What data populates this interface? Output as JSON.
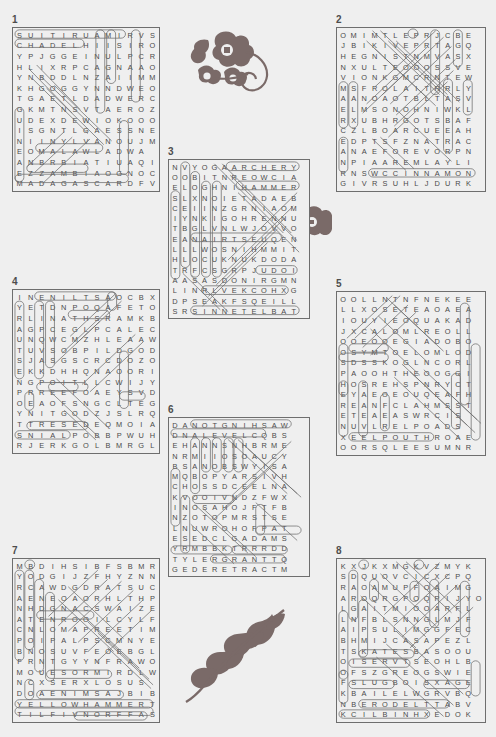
{
  "page": {
    "type": "word-search-answer-key",
    "background_color": "#efefef",
    "ink_color": "#5a5a5a",
    "puzzle_count": 8
  },
  "puzzles": [
    {
      "number": "1",
      "cols": 13,
      "rows": 16,
      "rows_text": [
        "SUITIRUAMIRVS",
        "CHADELHIISIRO",
        "YPJGGEINULPCR",
        "HLIXRPCAGNAAO",
        "YNBDDLNZAIIMM",
        "KHGOGGYNNDWEO",
        "TGAETLDADWERC",
        "GKMTNSVTAEROZ",
        "UDEXDEWIOKOOO",
        "ISGNTLGAESSNE",
        "NIINYLVANOUJM",
        "EOMALAWLADWA",
        "ANBRBIATIUAQI",
        "EZZAMBIAOGNOC",
        "MADAGASCARDFV"
      ]
    },
    {
      "number": "2",
      "cols": 14,
      "rows": 16,
      "rows_text": [
        "OMIMTLEPRJCBE",
        "JBIKIVEPRTAGQ",
        "HEGNISTNMVASX",
        "NXULTEOOOSSVE",
        "VIONKGMCRNTEW",
        "MSFROLAITRRLY",
        "AANOAOTBLTASV",
        "ELMSONOHNIWKL",
        "RXUBHRGOTSBAF",
        "CZLBOARCUEEAH",
        "EDPTSFZNATRAC",
        "ANAEFOREVORPN",
        "NPIAAREMLAYLI",
        "RNSWCCINNAMON",
        "GIVRSUHLJDURK"
      ]
    },
    {
      "number": "3",
      "cols": 14,
      "rows": 15,
      "rows_text": [
        "NVYOGAARCHERY",
        "OOBITNREOWCIA",
        "ELOGHNIHAMMER",
        "SLXNOIETADAEB",
        "CEIINZGRNIAOM",
        "IYNKIGOHRENNU",
        "TBGLVNLWJOVVO",
        "EANAIRTSEUQEN",
        "LLLWOSNIHMMIT",
        "HLOCUKNUKDODA",
        "TRFCSGRPJUDOI",
        "AASASDONIRGMN",
        "LINRLVEKCOHXG",
        "DPSEAKFSQEILL",
        "SRSINNETELBAT"
      ]
    },
    {
      "number": "4",
      "cols": 13,
      "rows": 16,
      "rows_text": [
        "INENILTSAOCBX",
        "YETDNPOQAFETO",
        "RLINATHSRAMKB",
        "AGPCEGLPCALEC",
        "UNQWCMZHLEAAW",
        "TUVSOBPILDGOD",
        "SJASGSCRCDOZO",
        "EKKDHHQNAOORI",
        "NGPOITLLCWIJY",
        "PRREEFOAEYSVD",
        "OEAOFSNGCLTEG",
        "YNITGODZJSLRQ",
        "TTRESEDEQMOIA",
        "SNIALPOBBPWUH",
        "RJERKGOLBMRGL"
      ]
    },
    {
      "number": "5",
      "cols": 14,
      "rows": 16,
      "rows_text": [
        "OOLLNTNFNEKEE",
        "LLXOSETEAOAEA",
        "IOUYIEOQUAKAD",
        "JXCALOMLREOLL",
        "OOEOOEGIADOBO",
        "OSYMTOELOMLOD",
        "SDSSKOGLNCORL",
        "PAOOHTHEOOGGI",
        "HOSREHSPNRYCT",
        "EYAEOEOUQEAFH",
        "REANFCLAHMSST",
        "ETEAEASWRCIS",
        "NUVLRELPOADS",
        "XEELPOUTHROAE",
        "OORSQLEESUMNR"
      ]
    },
    {
      "number": "6",
      "cols": 14,
      "rows": 16,
      "rows_text": [
        "DANOTGNIHSAW",
        "DNALEVELCQBS",
        "EHANNSNHBRME",
        "NRMIIOSOAUCY",
        "BSANOBSWYISA",
        "MQBOPYARSIVH",
        "CHOSSDCEELNA",
        "KVOOIVNDZFWX",
        "INOSAHOJFTFB",
        "NZOTOPMRSTSE",
        "LNUWROHOFPAT",
        "ESEDCLGADAMS",
        "YRMBBKTRRRDD",
        "TYLERGRANTTQ",
        "GEDERETRACTM"
      ]
    },
    {
      "number": "7",
      "cols": 13,
      "rows": 16,
      "rows_text": [
        "MBDIHSIBFSBMR",
        "YODGIJZFHYZNN",
        "RCAWDGDRATSUC",
        "AENEOAORHLTHP",
        "NHDGNACSWAIZE",
        "ATENROOILCYLF",
        "CNLOMAPREETIM",
        "POIPALPSCMNYE",
        "BNOSUVFEOEBGL",
        "FRNTGYYNFRAWO",
        "MOUESORMIRDLW",
        "NCXSERXLOSUS",
        "DOAENIMSAJBIB",
        "YELLOWHAMMERT",
        "TILFIVNORFFAS"
      ]
    },
    {
      "number": "8",
      "cols": 14,
      "rows": 16,
      "rows_text": [
        "KXJKXMGKVZMYK",
        "SDQUOVCICXCPQ",
        "RAOAMUPFOAIMG",
        "AROQRGPOQPIJYO",
        "LGAITMIOOARFL",
        "LNFBLSNNGLMJF",
        "AIPSULIMGGFEC",
        "BHMIJCASAPEZL",
        "TSKATESBASOOU",
        "OISERVTSEOHLB",
        "OFSZGREOGSWIE",
        "FSLUGBOISXAGE",
        "KBAILELWGRVBQ",
        "NBERODELTTABV",
        "KCILBINHXEDOK"
      ]
    }
  ],
  "decorations": [
    {
      "name": "flower-vine-ornament",
      "position": "top-right"
    },
    {
      "name": "single-blossom-ornament",
      "position": "middle-right"
    },
    {
      "name": "leafy-branch-ornament",
      "position": "bottom-center"
    }
  ]
}
